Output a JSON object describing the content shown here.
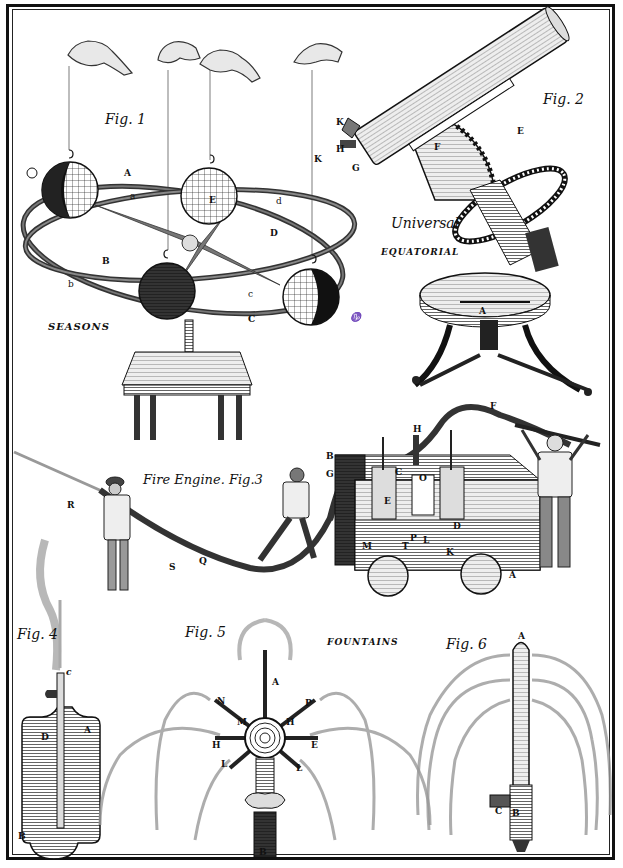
{
  "plate": {
    "figures": [
      {
        "id": "fig1",
        "title": "Fig. 1",
        "caption": "SEASONS",
        "subject": "orrery-seasons-model",
        "labels": [
          "A",
          "a",
          "B",
          "b",
          "C",
          "c",
          "D",
          "d",
          "E",
          "K"
        ],
        "symbols": [
          "cancer-sign",
          "capricorn-sign"
        ]
      },
      {
        "id": "fig2",
        "title": "Fig. 2",
        "caption_line1": "Universal",
        "caption_line2": "EQUATORIAL",
        "subject": "universal-equatorial-telescope",
        "labels": [
          "K",
          "H",
          "G",
          "F",
          "E",
          "A"
        ]
      },
      {
        "id": "fig3",
        "title": "Fire Engine. Fig.3",
        "subject": "fire-engine",
        "labels": [
          "R",
          "S",
          "Q",
          "B",
          "G",
          "H",
          "F",
          "C",
          "O",
          "E",
          "D",
          "M",
          "T",
          "P",
          "L",
          "K",
          "A"
        ]
      },
      {
        "id": "fig4",
        "title": "Fig. 4",
        "subject": "fountain-vessel",
        "labels": [
          "c",
          "D",
          "A",
          "B"
        ]
      },
      {
        "id": "fig5",
        "title": "Fig. 5",
        "caption": "FOUNTAINS",
        "subject": "multi-jet-fountain",
        "labels": [
          "A",
          "N",
          "P",
          "M",
          "H",
          "H",
          "E",
          "L",
          "L",
          "B"
        ]
      },
      {
        "id": "fig6",
        "title": "Fig. 6",
        "subject": "weeping-fountain",
        "labels": [
          "A",
          "C",
          "B"
        ]
      }
    ],
    "colors": {
      "ink": "#111111",
      "paper": "#ffffff",
      "shade": "#555555"
    }
  }
}
